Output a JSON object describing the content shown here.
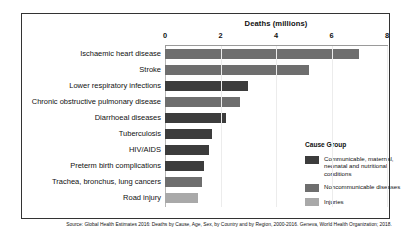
{
  "chart_data": {
    "type": "bar",
    "orientation": "horizontal",
    "title": "Deaths (millions)",
    "xlabel": "Deaths (millions)",
    "ylabel": "",
    "xlim": [
      0,
      8
    ],
    "xticks": [
      0,
      2,
      4,
      6,
      8
    ],
    "grid": true,
    "legend_position": "right",
    "legend_title": "Cause Group",
    "categories": [
      "Ischaemic heart disease",
      "Stroke",
      "Lower respiratory infections",
      "Chronic obstructive pulmonary disease",
      "Diarrhoeal diseases",
      "Tuberculosis",
      "HIV/AIDS",
      "Preterm birth complications",
      "Trachea, bronchus, lung cancers",
      "Road injury"
    ],
    "values": [
      7.0,
      5.2,
      3.0,
      2.7,
      2.2,
      1.7,
      1.6,
      1.4,
      1.35,
      1.2
    ],
    "groups": [
      "noncommunicable",
      "noncommunicable",
      "communicable",
      "noncommunicable",
      "communicable",
      "communicable",
      "communicable",
      "communicable",
      "noncommunicable",
      "injuries"
    ],
    "series": [
      {
        "name": "Communicable, maternal, neonatal and nutritional conditions",
        "key": "communicable",
        "color": "#3c3c3c"
      },
      {
        "name": "Noncommunicable diseases",
        "key": "noncommunicable",
        "color": "#6e6e6e"
      },
      {
        "name": "Injuries",
        "key": "injuries",
        "color": "#a9a9a9"
      }
    ],
    "source": "Source: Global Health Estimates 2016: Deaths by Cause, Age, Sex, by Country and by Region, 2000-2016. Geneva, World Health Organization; 2018."
  }
}
